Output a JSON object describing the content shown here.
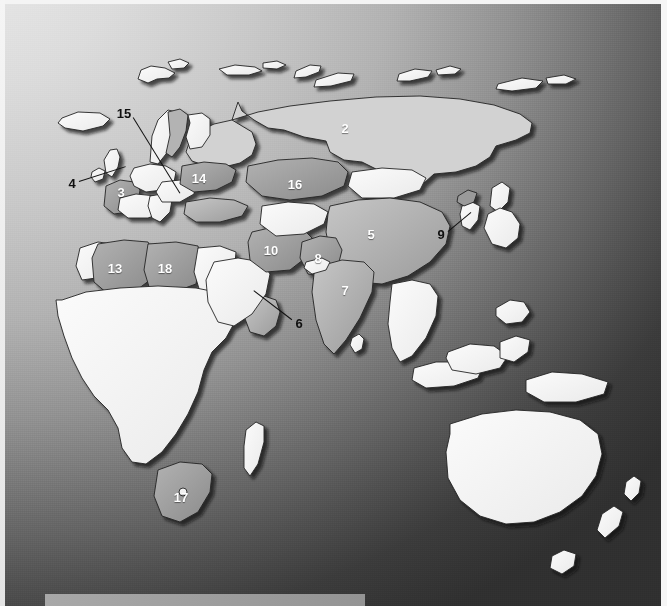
{
  "figure": {
    "kind": "world-map",
    "projection": "global eastern hemisphere",
    "background_style": "diagonal grayscale gradient, light at top-left to dark at bottom-right",
    "caption_bar": {
      "present": true,
      "color": "#9d9d9d",
      "text": ""
    }
  },
  "palette": {
    "highlight_dark": "#8e8e8e",
    "highlight_mid": "#a2a2a2",
    "highlight_light": "#c2c2c2",
    "land_default": "#f2f2f2",
    "border": "#2a2a2a",
    "shadow": "#1b1b1b",
    "label_inside": "#ffffff",
    "label_outside": "#101010",
    "bg_light": "#e9e9e9",
    "bg_dark": "#303030"
  },
  "labels": [
    {
      "id": "label-2",
      "text": "2",
      "x": 345,
      "y": 128,
      "placement": "inside",
      "region": "russia"
    },
    {
      "id": "label-3",
      "text": "3",
      "x": 121,
      "y": 192,
      "placement": "inside",
      "region": "france"
    },
    {
      "id": "label-4",
      "text": "4",
      "x": 72,
      "y": 183,
      "placement": "outside",
      "region": "united-kingdom-ireland",
      "leader": {
        "x1": 79,
        "y1": 181,
        "x2": 126,
        "y2": 166
      }
    },
    {
      "id": "label-5",
      "text": "5",
      "x": 371,
      "y": 234,
      "placement": "inside",
      "region": "china"
    },
    {
      "id": "label-6",
      "text": "6",
      "x": 299,
      "y": 323,
      "placement": "outside",
      "region": "gulf-states",
      "leader": {
        "x1": 292,
        "y1": 319,
        "x2": 254,
        "y2": 290
      }
    },
    {
      "id": "label-7",
      "text": "7",
      "x": 345,
      "y": 290,
      "placement": "inside",
      "region": "india"
    },
    {
      "id": "label-8",
      "text": "8",
      "x": 318,
      "y": 258,
      "placement": "inside",
      "region": "pakistan"
    },
    {
      "id": "label-9",
      "text": "9",
      "x": 441,
      "y": 234,
      "placement": "outside",
      "region": "south-korea",
      "leader": {
        "x1": 448,
        "y1": 231,
        "x2": 471,
        "y2": 212
      }
    },
    {
      "id": "label-10",
      "text": "10",
      "x": 271,
      "y": 250,
      "placement": "inside",
      "region": "iran"
    },
    {
      "id": "label-13",
      "text": "13",
      "x": 115,
      "y": 268,
      "placement": "inside",
      "region": "algeria"
    },
    {
      "id": "label-14",
      "text": "14",
      "x": 199,
      "y": 178,
      "placement": "inside",
      "region": "ukraine"
    },
    {
      "id": "label-15",
      "text": "15",
      "x": 124,
      "y": 113,
      "placement": "outside",
      "region": "sweden",
      "leader": {
        "x1": 133,
        "y1": 117,
        "x2": 180,
        "y2": 193
      }
    },
    {
      "id": "label-16",
      "text": "16",
      "x": 295,
      "y": 184,
      "placement": "inside",
      "region": "kazakhstan"
    },
    {
      "id": "label-17",
      "text": "17",
      "x": 181,
      "y": 497,
      "placement": "inside",
      "region": "south-africa"
    },
    {
      "id": "label-18",
      "text": "18",
      "x": 165,
      "y": 268,
      "placement": "inside",
      "region": "libya"
    }
  ]
}
